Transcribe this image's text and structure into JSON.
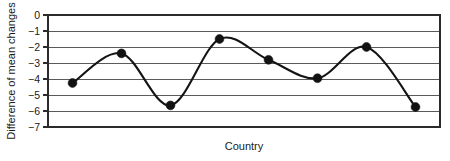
{
  "chart_data": {
    "type": "line",
    "title": "",
    "subtitle": "",
    "xlabel": "Country",
    "ylabel": "Difference of mean changes",
    "x": [
      1,
      2,
      3,
      4,
      5,
      6,
      7,
      8
    ],
    "values": [
      -4.25,
      -2.4,
      -5.65,
      -1.5,
      -2.8,
      -3.95,
      -2.0,
      -5.75
    ],
    "series": [
      {
        "name": "Difference of mean changes",
        "values": [
          -4.25,
          -2.4,
          -5.65,
          -1.5,
          -2.8,
          -3.95,
          -2.0,
          -5.75
        ]
      }
    ],
    "categories": [
      "",
      "",
      "",
      "",
      "",
      "",
      "",
      ""
    ],
    "ylim": [
      -7,
      0
    ],
    "xlim": [
      0.5,
      8.5
    ],
    "yticks": [
      0,
      -1,
      -2,
      -3,
      -4,
      -5,
      -6,
      -7
    ],
    "ytick_labels": [
      "0",
      "−1",
      "−2",
      "−3",
      "−4",
      "−5",
      "−6",
      "−7"
    ],
    "xticks": [],
    "xtick_labels": [],
    "grid": true,
    "grid_axis": "y",
    "legend": false,
    "legend_position": "none",
    "marker": "filled-circle",
    "line_style": "smooth",
    "annotations": []
  },
  "axes": {
    "y_title": "Difference of mean changes",
    "x_title": "Country"
  }
}
